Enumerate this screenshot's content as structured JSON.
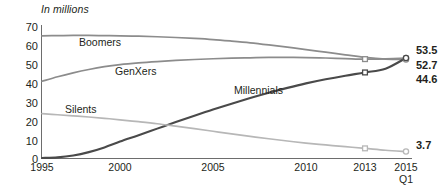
{
  "chart_data": {
    "type": "line",
    "title": "In millions",
    "xlabel": "",
    "ylabel": "",
    "ylim": [
      0,
      70
    ],
    "yticks": [
      0,
      10,
      20,
      30,
      40,
      50,
      60,
      70
    ],
    "xlim": [
      1995,
      2015
    ],
    "xticks": [
      "1995",
      "2000",
      "2005",
      "2010",
      "2013",
      "2015"
    ],
    "xtick_sub": [
      "",
      "",
      "",
      "",
      "",
      "Q1"
    ],
    "grid": false,
    "legend": "inline-labels",
    "series": [
      {
        "name": "Boomers",
        "color": "#8c8c8c",
        "end_value": "52.7",
        "x": [
          1995,
          1996,
          1997,
          1998,
          1999,
          2000,
          2001,
          2002,
          2003,
          2004,
          2005,
          2006,
          2007,
          2008,
          2009,
          2010,
          2011,
          2012,
          2013,
          2014,
          2015
        ],
        "values": [
          65.3,
          65.4,
          65.5,
          65.5,
          65.4,
          65.3,
          65.1,
          64.8,
          64.4,
          63.9,
          63.3,
          62.5,
          61.6,
          60.5,
          59.3,
          58.0,
          56.6,
          55.2,
          53.8,
          52.9,
          52.7
        ]
      },
      {
        "name": "GenXers",
        "color": "#8c8c8c",
        "end_value": "53.5",
        "x": [
          1995,
          1996,
          1997,
          1998,
          1999,
          2000,
          2001,
          2002,
          2003,
          2004,
          2005,
          2006,
          2007,
          2008,
          2009,
          2010,
          2011,
          2012,
          2013,
          2014,
          2015
        ],
        "values": [
          41.1,
          43.5,
          45.6,
          47.4,
          48.9,
          50.0,
          50.9,
          51.6,
          52.2,
          52.7,
          53.1,
          53.4,
          53.6,
          53.8,
          53.8,
          53.7,
          53.5,
          53.2,
          52.9,
          53.1,
          53.5
        ]
      },
      {
        "name": "Millennials",
        "color": "#4a4a4a",
        "end_value": "44.6",
        "x": [
          1995,
          1996,
          1997,
          1998,
          1999,
          2000,
          2001,
          2002,
          2003,
          2004,
          2005,
          2006,
          2007,
          2008,
          2009,
          2010,
          2011,
          2012,
          2013,
          2014,
          2015
        ],
        "values": [
          0.3,
          0.6,
          1.6,
          3.4,
          5.9,
          9.0,
          12.4,
          15.9,
          19.4,
          22.8,
          26.1,
          29.2,
          32.2,
          35.0,
          37.6,
          40.0,
          42.2,
          44.1,
          45.8,
          47.8,
          53.5
        ]
      },
      {
        "name": "Silents",
        "color": "#b7b7b7",
        "end_value": "3.7",
        "x": [
          1995,
          1996,
          1997,
          1998,
          1999,
          2000,
          2001,
          2002,
          2003,
          2004,
          2005,
          2006,
          2007,
          2008,
          2009,
          2010,
          2011,
          2012,
          2013,
          2014,
          2015
        ],
        "values": [
          23.9,
          23.3,
          22.7,
          22.1,
          21.4,
          20.6,
          19.6,
          18.5,
          17.2,
          15.9,
          14.5,
          13.1,
          11.8,
          10.5,
          9.3,
          8.2,
          7.2,
          6.3,
          5.4,
          4.4,
          3.7
        ]
      }
    ],
    "end_labels": [
      {
        "text": "53.5",
        "series": "Millennials"
      },
      {
        "text": "52.7",
        "series": "Boomers"
      },
      {
        "text": "44.6",
        "series": "GenXers"
      },
      {
        "text": "3.7",
        "series": "Silents"
      }
    ],
    "markers_2013": [
      "GenXers",
      "Millennials",
      "Silents"
    ],
    "colors": {
      "axis": "#6d6d6d",
      "text": "#231f20",
      "boomers": "#8c8c8c",
      "genxers": "#8c8c8c",
      "millennials": "#4a4a4a",
      "silents": "#b7b7b7",
      "background": "#ffffff"
    }
  }
}
